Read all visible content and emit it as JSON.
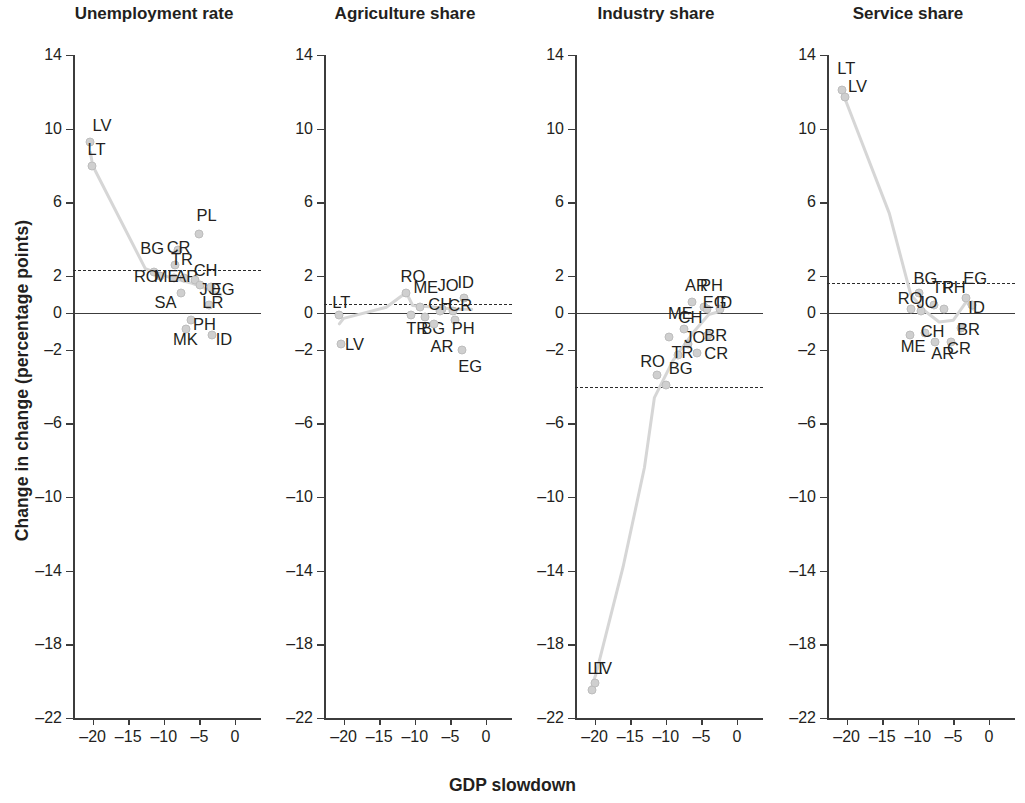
{
  "figure": {
    "xlabel": "GDP slowdown",
    "ylabel": "Change in change (percentage points)"
  },
  "chart_data": {
    "type": "scatter",
    "title": "",
    "xlabel": "GDP slowdown",
    "ylabel": "Change in change (percentage points)",
    "xlim": [
      -23,
      2
    ],
    "ylim": [
      -23,
      14
    ],
    "xticks": [
      -20,
      -15,
      -10,
      -5,
      0
    ],
    "xticklabels": [
      "–20",
      "–15",
      "–10",
      "–5",
      "0"
    ],
    "yticks": [
      14,
      10,
      6,
      2,
      0,
      -2,
      -6,
      -10,
      -14,
      -18,
      -22
    ],
    "yticklabels": [
      "14",
      "10",
      "6",
      "2",
      "0",
      "–2",
      "–6",
      "–10",
      "–14",
      "–18",
      "–22"
    ],
    "grid": false,
    "legend": "none",
    "panels": [
      {
        "title": "Unemployment rate",
        "mean_line": 2.3,
        "zero_line": 0,
        "trend": [
          [
            -20.3,
            8.7
          ],
          [
            -20.0,
            8.0
          ],
          [
            -12.6,
            2.4
          ],
          [
            -9.0,
            1.9
          ],
          [
            -6.0,
            1.6
          ],
          [
            -4.0,
            1.3
          ],
          [
            -2.0,
            1.0
          ]
        ],
        "points": [
          {
            "label": "LV",
            "x": -20.3,
            "y": 9.3,
            "lx": -20.0,
            "ly": 10.2,
            "anchor": "left"
          },
          {
            "label": "LT",
            "x": -20.1,
            "y": 8.0,
            "lx": -20.7,
            "ly": 8.9,
            "anchor": "left"
          },
          {
            "label": "PL",
            "x": -5.0,
            "y": 4.3,
            "lx": -5.4,
            "ly": 5.3,
            "anchor": "left"
          },
          {
            "label": "BG",
            "x": -11.4,
            "y": 2.2,
            "lx": -13.3,
            "ly": 3.5,
            "anchor": "left"
          },
          {
            "label": "CR",
            "x": -8.0,
            "y": 3.4,
            "lx": -9.6,
            "ly": 3.6,
            "anchor": "left"
          },
          {
            "label": "TR",
            "x": -8.4,
            "y": 2.6,
            "lx": -9.0,
            "ly": 2.9,
            "anchor": "left"
          },
          {
            "label": "RO",
            "x": -10.5,
            "y": 2.0,
            "lx": -14.2,
            "ly": 2.0,
            "anchor": "left"
          },
          {
            "label": "ME",
            "x": -8.6,
            "y": 1.9,
            "lx": -11.4,
            "ly": 2.0,
            "anchor": "left"
          },
          {
            "label": "AR",
            "x": -7.2,
            "y": 1.9,
            "lx": -8.4,
            "ly": 2.0,
            "anchor": "left"
          },
          {
            "label": "CH",
            "x": -5.6,
            "y": 1.8,
            "lx": -5.8,
            "ly": 2.3,
            "anchor": "left"
          },
          {
            "label": "JO",
            "x": -4.9,
            "y": 1.5,
            "lx": -5.0,
            "ly": 1.3,
            "anchor": "left"
          },
          {
            "label": "EG",
            "x": -3.4,
            "y": 1.4,
            "lx": -3.4,
            "ly": 1.3,
            "anchor": "left"
          },
          {
            "label": "SA",
            "x": -7.6,
            "y": 1.1,
            "lx": -11.3,
            "ly": 0.6,
            "anchor": "left"
          },
          {
            "label": "LR",
            "x": -3.7,
            "y": 0.4,
            "lx": -4.6,
            "ly": 0.6,
            "anchor": "left"
          },
          {
            "label": "PH",
            "x": -6.2,
            "y": -0.4,
            "lx": -5.9,
            "ly": -0.6,
            "anchor": "left"
          },
          {
            "label": "MK",
            "x": -6.9,
            "y": -0.9,
            "lx": -8.7,
            "ly": -1.4,
            "anchor": "left"
          },
          {
            "label": "ID",
            "x": -3.3,
            "y": -1.2,
            "lx": -2.7,
            "ly": -1.4,
            "anchor": "left"
          }
        ]
      },
      {
        "title": "Agriculture share",
        "mean_line": 0.5,
        "zero_line": 0,
        "trend": [
          [
            -20.6,
            -0.6
          ],
          [
            -20.0,
            -0.3
          ],
          [
            -14.0,
            0.3
          ],
          [
            -11.2,
            1.1
          ],
          [
            -10.3,
            0.4
          ],
          [
            -7.0,
            0.3
          ],
          [
            -4.5,
            0.2
          ],
          [
            -2.0,
            0.2
          ]
        ],
        "points": [
          {
            "label": "LT",
            "x": -20.6,
            "y": -0.1,
            "lx": -21.6,
            "ly": 0.6,
            "anchor": "left"
          },
          {
            "label": "LV",
            "x": -20.4,
            "y": -1.7,
            "lx": -19.8,
            "ly": -1.7,
            "anchor": "left"
          },
          {
            "label": "RO",
            "x": -11.3,
            "y": 1.1,
            "lx": -12.0,
            "ly": 2.0,
            "anchor": "left"
          },
          {
            "label": "ME",
            "x": -9.2,
            "y": 0.3,
            "lx": -10.2,
            "ly": 1.4,
            "anchor": "left"
          },
          {
            "label": "JO",
            "x": -6.2,
            "y": 0.2,
            "lx": -6.8,
            "ly": 1.5,
            "anchor": "left"
          },
          {
            "label": "ID",
            "x": -3.1,
            "y": 0.8,
            "lx": -4.0,
            "ly": 1.7,
            "anchor": "left"
          },
          {
            "label": "CH",
            "x": -6.4,
            "y": 0.1,
            "lx": -8.1,
            "ly": 0.5,
            "anchor": "left"
          },
          {
            "label": "CR",
            "x": -4.6,
            "y": 0.1,
            "lx": -5.3,
            "ly": 0.4,
            "anchor": "left"
          },
          {
            "label": "TR",
            "x": -10.6,
            "y": -0.1,
            "lx": -11.2,
            "ly": -0.8,
            "anchor": "left"
          },
          {
            "label": "BG",
            "x": -8.6,
            "y": -0.2,
            "lx": -9.1,
            "ly": -0.8,
            "anchor": "left"
          },
          {
            "label": "PH",
            "x": -4.3,
            "y": -0.4,
            "lx": -4.8,
            "ly": -0.8,
            "anchor": "left"
          },
          {
            "label": "AR",
            "x": -7.3,
            "y": -0.6,
            "lx": -7.8,
            "ly": -1.8,
            "anchor": "left"
          },
          {
            "label": "EG",
            "x": -3.4,
            "y": -2.0,
            "lx": -3.9,
            "ly": -2.9,
            "anchor": "left"
          }
        ]
      },
      {
        "title": "Industry share",
        "mean_line": -4.0,
        "zero_line": 0,
        "trend": [
          [
            -20.4,
            -20.3
          ],
          [
            -19.8,
            -19.6
          ],
          [
            -16.0,
            -13.8
          ],
          [
            -13.0,
            -8.4
          ],
          [
            -11.6,
            -4.6
          ],
          [
            -9.0,
            -2.6
          ],
          [
            -6.0,
            -1.0
          ],
          [
            -4.0,
            -0.1
          ],
          [
            -2.2,
            0.1
          ]
        ],
        "points": [
          {
            "label": "AR",
            "x": -6.3,
            "y": 0.6,
            "lx": -7.3,
            "ly": 1.5,
            "anchor": "left"
          },
          {
            "label": "PH",
            "x": -4.7,
            "y": 0.3,
            "lx": -5.2,
            "ly": 1.5,
            "anchor": "left"
          },
          {
            "label": "EG",
            "x": -4.2,
            "y": 0.2,
            "lx": -4.8,
            "ly": 0.6,
            "anchor": "left"
          },
          {
            "label": "ID",
            "x": -2.4,
            "y": 0.2,
            "lx": -3.0,
            "ly": 0.6,
            "anchor": "left"
          },
          {
            "label": "ME",
            "x": -9.6,
            "y": -1.3,
            "lx": -9.7,
            "ly": 0.0,
            "anchor": "left"
          },
          {
            "label": "CH",
            "x": -7.4,
            "y": -0.9,
            "lx": -8.2,
            "ly": -0.2,
            "anchor": "left"
          },
          {
            "label": "JO",
            "x": -6.9,
            "y": -1.7,
            "lx": -7.4,
            "ly": -1.3,
            "anchor": "left"
          },
          {
            "label": "BR",
            "x": -4.1,
            "y": -1.2,
            "lx": -4.6,
            "ly": -1.2,
            "anchor": "left"
          },
          {
            "label": "TR",
            "x": -8.3,
            "y": -2.3,
            "lx": -9.2,
            "ly": -2.1,
            "anchor": "left"
          },
          {
            "label": "CR",
            "x": -5.6,
            "y": -2.2,
            "lx": -4.6,
            "ly": -2.2,
            "anchor": "left"
          },
          {
            "label": "RO",
            "x": -11.3,
            "y": -3.4,
            "lx": -13.6,
            "ly": -2.6,
            "anchor": "left"
          },
          {
            "label": "BG",
            "x": -10.0,
            "y": -3.9,
            "lx": -9.6,
            "ly": -3.0,
            "anchor": "left"
          },
          {
            "label": "LT",
            "x": -20.4,
            "y": -20.5,
            "lx": -21.0,
            "ly": -19.3,
            "anchor": "left"
          },
          {
            "label": "LV",
            "x": -20.0,
            "y": -20.1,
            "lx": -20.2,
            "ly": -19.3,
            "anchor": "left"
          }
        ]
      },
      {
        "title": "Service share",
        "mean_line": 1.6,
        "zero_line": 0,
        "trend": [
          [
            -20.6,
            12.0
          ],
          [
            -20.2,
            11.6
          ],
          [
            -14.0,
            5.4
          ],
          [
            -11.0,
            1.0
          ],
          [
            -9.0,
            0.1
          ],
          [
            -7.0,
            -0.5
          ],
          [
            -5.0,
            -0.4
          ],
          [
            -3.2,
            0.6
          ],
          [
            -2.2,
            0.2
          ]
        ],
        "points": [
          {
            "label": "LT",
            "x": -20.6,
            "y": 12.1,
            "lx": -21.3,
            "ly": 13.3,
            "anchor": "left"
          },
          {
            "label": "LV",
            "x": -20.2,
            "y": 11.7,
            "lx": -19.8,
            "ly": 12.3,
            "anchor": "left"
          },
          {
            "label": "BG",
            "x": -9.9,
            "y": 1.1,
            "lx": -10.6,
            "ly": 1.9,
            "anchor": "left"
          },
          {
            "label": "TR",
            "x": -7.7,
            "y": 0.4,
            "lx": -8.0,
            "ly": 1.4,
            "anchor": "left"
          },
          {
            "label": "PH",
            "x": -6.3,
            "y": 0.2,
            "lx": -6.5,
            "ly": 1.4,
            "anchor": "left"
          },
          {
            "label": "EG",
            "x": -3.3,
            "y": 0.8,
            "lx": -3.6,
            "ly": 1.9,
            "anchor": "left"
          },
          {
            "label": "RO",
            "x": -10.9,
            "y": 0.2,
            "lx": -12.8,
            "ly": 0.8,
            "anchor": "left"
          },
          {
            "label": "JO",
            "x": -9.6,
            "y": 0.1,
            "lx": -10.2,
            "ly": 0.6,
            "anchor": "left"
          },
          {
            "label": "ID",
            "x": -2.4,
            "y": 0.4,
            "lx": -2.9,
            "ly": 0.3,
            "anchor": "left"
          },
          {
            "label": "CH",
            "x": -9.0,
            "y": -1.1,
            "lx": -9.6,
            "ly": -1.0,
            "anchor": "left"
          },
          {
            "label": "BR",
            "x": -4.0,
            "y": -0.8,
            "lx": -4.5,
            "ly": -0.9,
            "anchor": "left"
          },
          {
            "label": "ME",
            "x": -11.1,
            "y": -1.2,
            "lx": -12.4,
            "ly": -1.8,
            "anchor": "left"
          },
          {
            "label": "AR",
            "x": -7.6,
            "y": -1.6,
            "lx": -8.1,
            "ly": -2.2,
            "anchor": "left"
          },
          {
            "label": "CR",
            "x": -5.4,
            "y": -1.6,
            "lx": -5.9,
            "ly": -1.9,
            "anchor": "left"
          }
        ]
      }
    ]
  }
}
